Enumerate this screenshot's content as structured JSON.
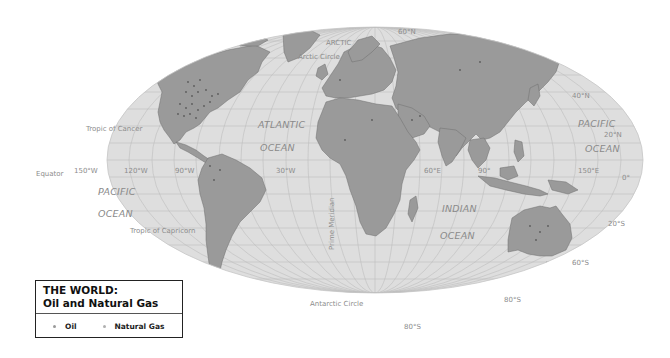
{
  "map": {
    "projection": "Mollweide",
    "colors": {
      "ocean": "#dedede",
      "land": "#9a9a9a",
      "grid": "#b9b9b9",
      "border": "#6f6f6f",
      "label": "#8c8c8c",
      "background": "#ffffff"
    },
    "oceans": [
      {
        "id": "atlantic",
        "line1": "ATLANTIC",
        "line2": "OCEAN"
      },
      {
        "id": "pacific-west",
        "line1": "PACIFIC",
        "line2": "OCEAN"
      },
      {
        "id": "pacific-east",
        "line1": "PACIFIC",
        "line2": "OCEAN"
      },
      {
        "id": "indian",
        "line1": "INDIAN",
        "line2": "OCEAN"
      },
      {
        "id": "arctic",
        "line1": "ARCTIC",
        "line2": "OCEAN"
      }
    ],
    "lines": {
      "arctic_circle": "Arctic Circle",
      "tropic_cancer": "Tropic of Cancer",
      "equator": "Equator",
      "tropic_capricorn": "Tropic of Capricorn",
      "antarctic_circle": "Antarctic Circle",
      "prime_meridian": "Prime Meridian"
    },
    "longitude_labels": [
      "150°W",
      "120°W",
      "90°W",
      "30°W",
      "60°E",
      "90°",
      "150°E"
    ],
    "latitude_labels": [
      "60°N",
      "40°N",
      "20°N",
      "0°",
      "20°S",
      "60°S",
      "80°S",
      "80°S"
    ]
  },
  "legend": {
    "title_line1": "THE WORLD:",
    "title_line2": "Oil and Natural Gas",
    "items": [
      {
        "label": "Oil",
        "color": "#9a9a9a"
      },
      {
        "label": "Natural Gas",
        "color": "#b0b0b0"
      }
    ]
  }
}
